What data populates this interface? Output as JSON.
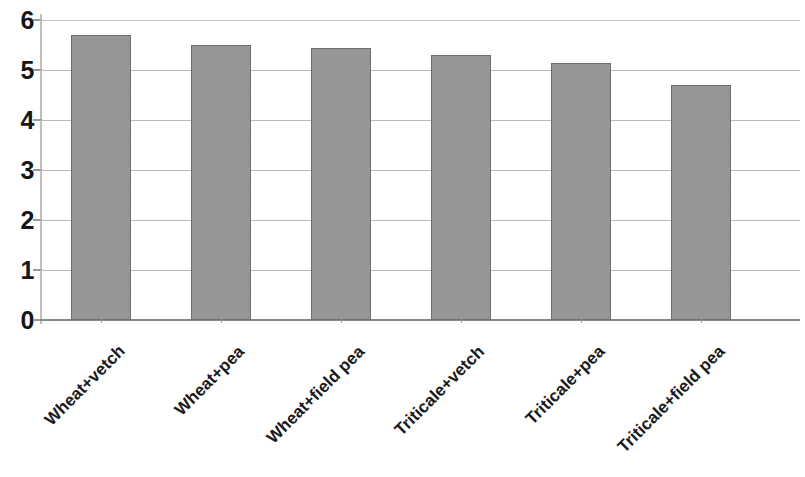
{
  "chart_data": {
    "type": "bar",
    "title": "",
    "subtitle": "",
    "xlabel": "",
    "ylabel": "",
    "categories": [
      "Wheat+vetch",
      "Wheat+pea",
      "Wheat+field pea",
      "Triticale+vetch",
      "Triticale+pea",
      "Triticale+field pea"
    ],
    "values": [
      5.7,
      5.5,
      5.45,
      5.3,
      5.15,
      4.7
    ],
    "ylim": [
      0,
      6
    ],
    "ytick_labels": [
      "0",
      "1",
      "2",
      "3",
      "4",
      "5",
      "6"
    ],
    "ytick_values": [
      0,
      1,
      2,
      3,
      4,
      5,
      6
    ],
    "grid": "horizontal",
    "legend": "none",
    "series_color": "#979797",
    "bar_edge_color": "#6f6f6f",
    "gridline_color": "#b9b9b9",
    "axis_color": "#8a8a8a",
    "text_color": "#1a1a1a",
    "background_color": "#ffffff",
    "xtick_label_rotation_degrees": 45,
    "annotations": []
  }
}
